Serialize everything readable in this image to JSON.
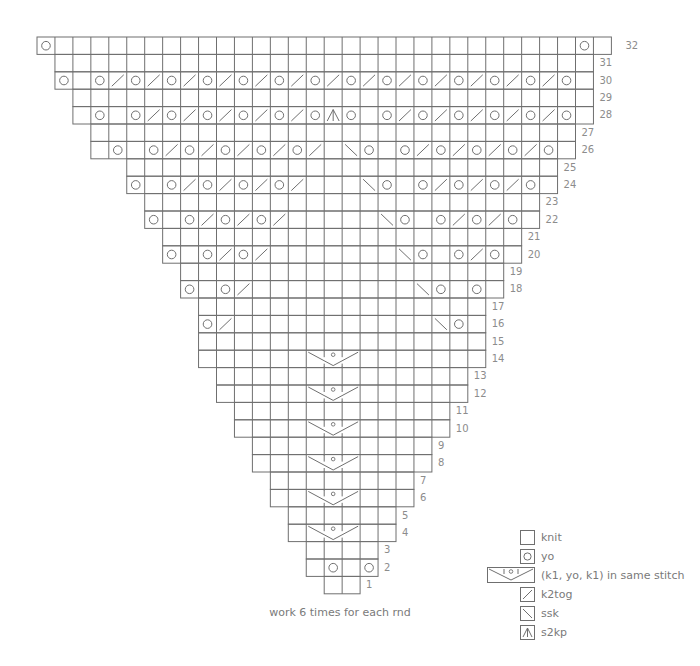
{
  "chart_data": {
    "type": "knitting-chart",
    "title": "",
    "grid": {
      "origin_x": 37,
      "top_y": 37,
      "cell_w": 17.95,
      "cell_h": 17.4,
      "total_rows": 32
    },
    "symbols": {
      "knit": "blank",
      "yo": "O",
      "k2tog": "K",
      "ssk": "S",
      "s2kp": "A",
      "k1yok1": "V"
    },
    "rows": [
      {
        "row": 32,
        "start": 0,
        "end": 32,
        "stitches": {
          "0": "O",
          "30": "O"
        }
      },
      {
        "row": 31,
        "start": 1,
        "end": 31,
        "stitches": {}
      },
      {
        "row": 30,
        "start": 1,
        "end": 31,
        "stitches": {
          "1": "O",
          "3": "O",
          "4": "K",
          "5": "O",
          "6": "K",
          "7": "O",
          "8": "K",
          "9": "O",
          "10": "K",
          "11": "O",
          "12": "K",
          "13": "O",
          "14": "K",
          "15": "O",
          "16": "K",
          "17": "O",
          "18": "K",
          "19": "O",
          "20": "K",
          "21": "O",
          "22": "K",
          "23": "O",
          "24": "K",
          "25": "O",
          "26": "K",
          "27": "O",
          "28": "K",
          "29": "O"
        }
      },
      {
        "row": 29,
        "start": 2,
        "end": 31,
        "stitches": {}
      },
      {
        "row": 28,
        "start": 2,
        "end": 31,
        "stitches": {
          "3": "O",
          "5": "O",
          "6": "K",
          "7": "O",
          "8": "K",
          "9": "O",
          "10": "K",
          "11": "O",
          "12": "K",
          "13": "O",
          "14": "K",
          "15": "O",
          "16": "A",
          "17": "O",
          "19": "O",
          "20": "K",
          "21": "O",
          "22": "K",
          "23": "O",
          "24": "K",
          "25": "O",
          "26": "K",
          "27": "O",
          "28": "K",
          "29": "O"
        }
      },
      {
        "row": 27,
        "start": 3,
        "end": 30,
        "stitches": {}
      },
      {
        "row": 26,
        "start": 3,
        "end": 30,
        "stitches": {
          "4": "O",
          "6": "O",
          "7": "K",
          "8": "O",
          "9": "K",
          "10": "O",
          "11": "K",
          "12": "O",
          "13": "K",
          "14": "O",
          "15": "K",
          "17": "S",
          "18": "O",
          "20": "O",
          "21": "K",
          "22": "O",
          "23": "K",
          "24": "O",
          "25": "K",
          "26": "O",
          "27": "K",
          "28": "O"
        }
      },
      {
        "row": 25,
        "start": 5,
        "end": 29,
        "stitches": {}
      },
      {
        "row": 24,
        "start": 5,
        "end": 29,
        "stitches": {
          "5": "O",
          "7": "O",
          "8": "K",
          "9": "O",
          "10": "K",
          "11": "O",
          "12": "K",
          "13": "O",
          "14": "K",
          "18": "S",
          "19": "O",
          "21": "O",
          "22": "K",
          "23": "O",
          "24": "K",
          "25": "O",
          "26": "K",
          "27": "O"
        }
      },
      {
        "row": 23,
        "start": 6,
        "end": 28,
        "stitches": {}
      },
      {
        "row": 22,
        "start": 6,
        "end": 28,
        "stitches": {
          "6": "O",
          "8": "O",
          "9": "K",
          "10": "O",
          "11": "K",
          "12": "O",
          "13": "K",
          "19": "S",
          "20": "O",
          "22": "O",
          "23": "K",
          "24": "O",
          "25": "K",
          "26": "O"
        }
      },
      {
        "row": 21,
        "start": 7,
        "end": 27,
        "stitches": {}
      },
      {
        "row": 20,
        "start": 7,
        "end": 27,
        "stitches": {
          "7": "O",
          "9": "O",
          "10": "K",
          "11": "O",
          "12": "K",
          "20": "S",
          "21": "O",
          "23": "O",
          "24": "K",
          "25": "O"
        }
      },
      {
        "row": 19,
        "start": 8,
        "end": 26,
        "stitches": {}
      },
      {
        "row": 18,
        "start": 8,
        "end": 26,
        "stitches": {
          "8": "O",
          "10": "O",
          "11": "K",
          "21": "S",
          "22": "O",
          "24": "O"
        }
      },
      {
        "row": 17,
        "start": 9,
        "end": 25,
        "stitches": {}
      },
      {
        "row": 16,
        "start": 9,
        "end": 25,
        "stitches": {
          "9": "O",
          "10": "K",
          "22": "S",
          "23": "O"
        }
      },
      {
        "row": 15,
        "start": 9,
        "end": 25,
        "stitches": {}
      },
      {
        "row": 14,
        "start": 9,
        "end": 25,
        "stitches": {
          "15": "V"
        }
      },
      {
        "row": 13,
        "start": 10,
        "end": 24,
        "stitches": {}
      },
      {
        "row": 12,
        "start": 10,
        "end": 24,
        "stitches": {
          "15": "V"
        }
      },
      {
        "row": 11,
        "start": 11,
        "end": 23,
        "stitches": {}
      },
      {
        "row": 10,
        "start": 11,
        "end": 23,
        "stitches": {
          "15": "V"
        }
      },
      {
        "row": 9,
        "start": 12,
        "end": 22,
        "stitches": {}
      },
      {
        "row": 8,
        "start": 12,
        "end": 22,
        "stitches": {
          "15": "V"
        }
      },
      {
        "row": 7,
        "start": 13,
        "end": 21,
        "stitches": {}
      },
      {
        "row": 6,
        "start": 13,
        "end": 21,
        "stitches": {
          "15": "V"
        }
      },
      {
        "row": 5,
        "start": 14,
        "end": 20,
        "stitches": {}
      },
      {
        "row": 4,
        "start": 14,
        "end": 20,
        "stitches": {
          "15": "V"
        }
      },
      {
        "row": 3,
        "start": 15,
        "end": 19,
        "stitches": {}
      },
      {
        "row": 2,
        "start": 15,
        "end": 19,
        "stitches": {
          "16": "O",
          "18": "O"
        }
      },
      {
        "row": 1,
        "start": 16,
        "end": 18,
        "stitches": {}
      }
    ],
    "footer": "work 6 times for each rnd"
  },
  "footer": {
    "text": "work 6 times for each rnd"
  },
  "legend": [
    {
      "symbol": "blank",
      "label": "knit",
      "icon": "knit-icon"
    },
    {
      "symbol": "O",
      "label": "yo",
      "icon": "yo-icon"
    },
    {
      "symbol": "V",
      "label": "(k1, yo, k1) in same stitch",
      "icon": "k1-yo-k1-icon"
    },
    {
      "symbol": "K",
      "label": "k2tog",
      "icon": "k2tog-icon"
    },
    {
      "symbol": "S",
      "label": "ssk",
      "icon": "ssk-icon"
    },
    {
      "symbol": "A",
      "label": "s2kp",
      "icon": "s2kp-icon"
    }
  ],
  "colors": {
    "line": "#6f6f6f",
    "text": "#8a8a8a",
    "background": "#ffffff"
  }
}
